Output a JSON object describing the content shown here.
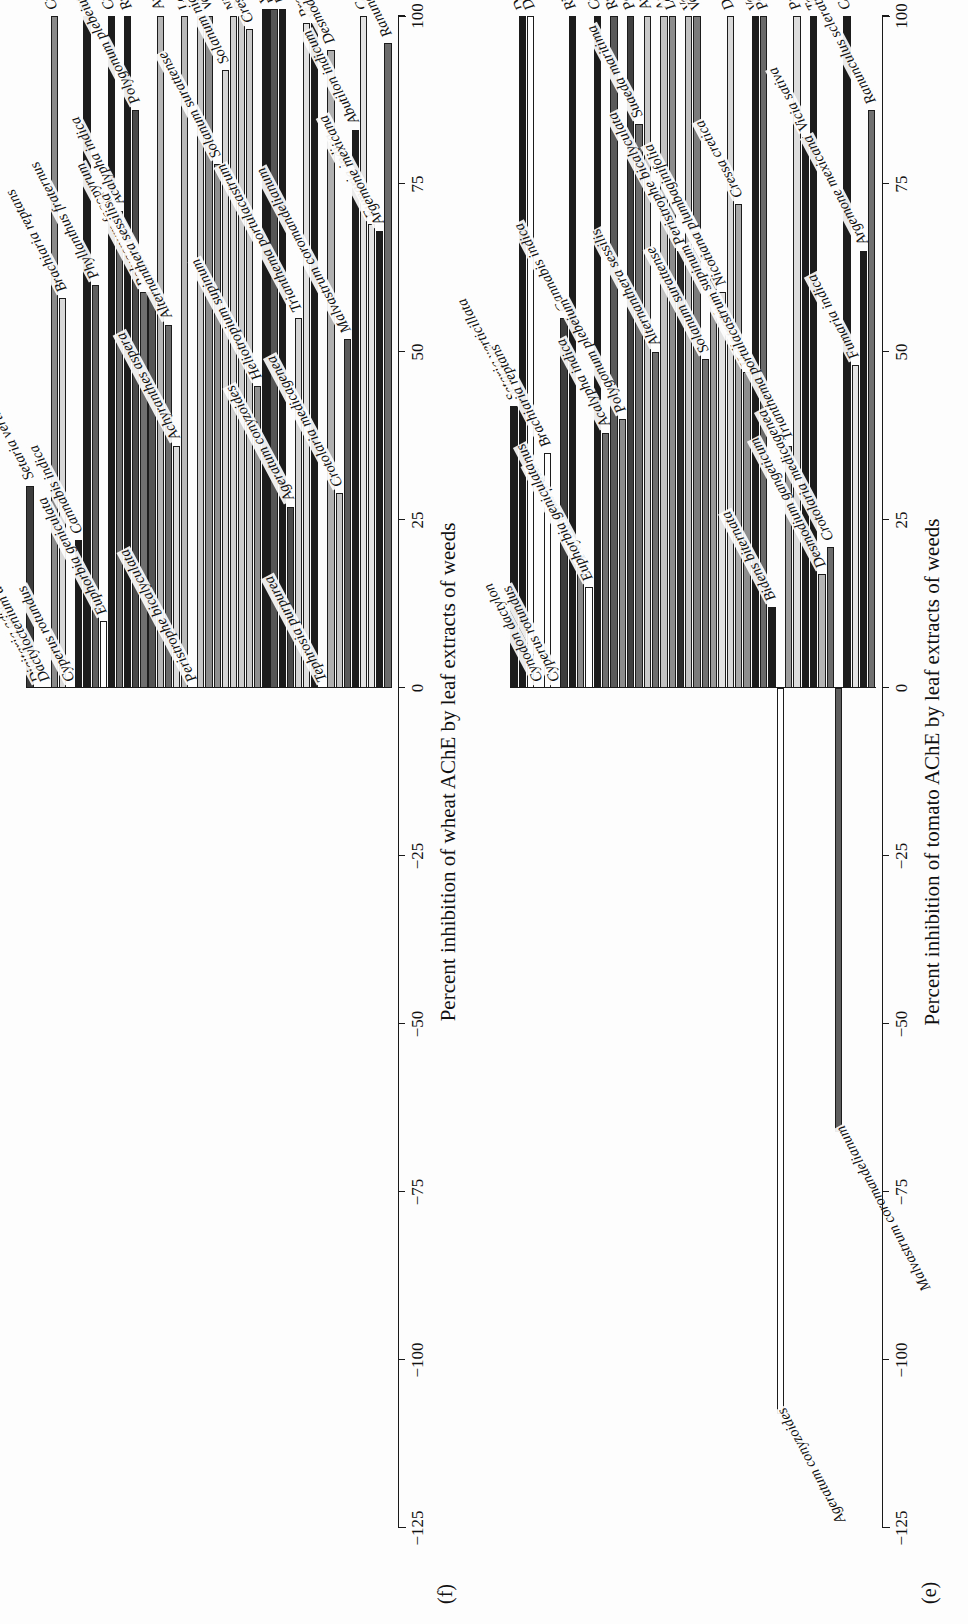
{
  "figure": {
    "background": "#fdfdfd",
    "orientation": "rotated-90-ccw"
  },
  "chart_data": [
    {
      "id": "e",
      "panel_letter": "(e)",
      "type": "bar",
      "orientation": "horizontal",
      "title": "",
      "xlabel": "Percent inhibition of tomato AChE by leaf extracts of weeds",
      "ylabel": "",
      "xlim": [
        -125,
        100
      ],
      "ticks": [
        -125,
        -100,
        -75,
        -50,
        -25,
        0,
        25,
        50,
        75,
        100
      ],
      "tick_labels": [
        "−125",
        "−100",
        "−75",
        "−50",
        "−25",
        "0",
        "25",
        "50",
        "75",
        "100"
      ],
      "grid": false,
      "legend": "none",
      "categories": [
        "Setaria verticillata",
        "Digitaria adscendens",
        "Dactyloctenium aegyptium",
        "Cynodon dactylon",
        "Brachiaria reptans",
        "Cyperus rotundus",
        "Cannabis indica",
        "Ricinus communis",
        "Phyllanthus fraternus",
        "Euphorbia geniculata",
        "Croton bonplandianum",
        "Acalypha indica",
        "Rumex dentatus",
        "Polygonum plebeium",
        "Polygonum fagopyrum",
        "Suaeda maritima",
        "Amaranthus gracilis",
        "Alternanthera sessilis",
        "Achyranthes aspera",
        "Lantana camara",
        "Peristrophe bicalyculata",
        "Veronica agrestis",
        "Verbascum chinense",
        "Solanum surattense",
        "Solanum nigrum",
        "Nicotiana plumbaginifolia",
        "Datura innoxia",
        "Cressa cretica",
        "Heliotropium supinum",
        "Vernonia cinerea",
        "Parthenium hysterophorus",
        "Bidens biternata",
        "Ageratum conyzoides",
        "Trianthema portulacastrum",
        "Prosopis juliflora",
        "Vicia sativa",
        "Tephrosia purpurea",
        "Desmodium gangeticum",
        "Crotolaria medicagenea",
        "Malvastrum coromandelianum",
        "Coronopus didymus",
        "Fumaria indica",
        "Argemone mexicana",
        "Ranunculus scleratus"
      ],
      "values": [
        42,
        100,
        100,
        0,
        35,
        0,
        55,
        100,
        18,
        15,
        100,
        38,
        100,
        40,
        100,
        84,
        100,
        50,
        100,
        100,
        65,
        100,
        100,
        49,
        61,
        59,
        100,
        72,
        47,
        100,
        100,
        12,
        -108,
        36,
        100,
        82,
        100,
        17,
        21,
        -66,
        100,
        48,
        65,
        86
      ],
      "bar_colors": [
        "#1c1c1c",
        "#1c1c1c",
        "#ffffff",
        "#ffffff",
        "#ffffff",
        "#1c1c1c",
        "#3d3d3d",
        "#1c1c1c",
        "#8a8a8a",
        "#ffffff",
        "#1c1c1c",
        "#6e6e6e",
        "#5a5a5a",
        "#8c8c8c",
        "#3f3f3f",
        "#6b6b6b",
        "#c9c9c9",
        "#6f6f6f",
        "#c2c2c2",
        "#8c8c8c",
        "#2a2a2a",
        "#c0c0c0",
        "#7b7b7b",
        "#707070",
        "#9a9a9a",
        "#e2e2e2",
        "#d8d8d8",
        "#a8a8a8",
        "#8e8e8e",
        "#1c1c1c",
        "#6a6a6a",
        "#1c1c1c",
        "#ffffff",
        "#9b9b9b",
        "#dcdcdc",
        "#1c1c1c",
        "#1c1c1c",
        "#b4b4b4",
        "#6b6b6b",
        "#5e5e5e",
        "#1c1c1c",
        "#e4e4e4",
        "#1c1c1c",
        "#707070"
      ]
    },
    {
      "id": "f",
      "panel_letter": "(f)",
      "type": "bar",
      "orientation": "horizontal",
      "title": "",
      "xlabel": "Percent inhibition of wheat AChE by leaf extracts of weeds",
      "ylabel": "",
      "xlim": [
        -125,
        100
      ],
      "ticks": [
        -125,
        -100,
        -75,
        -50,
        -25,
        0,
        25,
        50,
        75,
        100
      ],
      "tick_labels": [
        "−125",
        "−100",
        "−75",
        "−50",
        "−25",
        "0",
        "25",
        "50",
        "75",
        "100"
      ],
      "grid": false,
      "legend": "none",
      "categories": [
        "Setaria verticillata",
        "Digitaria adscendens",
        "Dactyloctenium aegyptium",
        "Cynodon dactylon",
        "Brachiaria reptans",
        "Cyperus rotundus",
        "Cannabis indica",
        "Ricinus communis",
        "Phyllanthus fraternus",
        "Euphorbia geniculata",
        "Croton bonplandianum",
        "Acalypha indica",
        "Rumex dentatus",
        "Polygonum plebeium",
        "Polygonum fagopyrum",
        "Suaeda maritima",
        "Amaranthus gracilis",
        "Alternanthera sessilis",
        "Achyranthes aspera",
        "Lantana camara",
        "Peristrophe bicalyculata",
        "Veronica agrestis",
        "Verbascum chinense",
        "Solanum surattense",
        "Solanum nigrum",
        "Nicotiana plumbaginifolia",
        "Datura innoxia",
        "Cressa cretica",
        "Heliotropium supinum",
        "Vernonia cinerea",
        "Parthenium hysterophorus",
        "Bidens biternata",
        "Ageratum conyzoides",
        "Trianthema portulacastrum",
        "Prosopis juliflora",
        "Vicia sativa",
        "Tephrosia purpurea",
        "Desmodium gangeticum",
        "Crotolaria medicagenea",
        "Malvastrum coromandelianum",
        "Abutilon indicum",
        "Coronopus didymus",
        "Fumaria indica",
        "Argemone mexicana",
        "Ranunculus scleratus"
      ],
      "values": [
        30,
        0,
        0,
        100,
        58,
        0,
        22,
        100,
        60,
        10,
        100,
        71,
        100,
        86,
        59,
        59,
        100,
        54,
        36,
        100,
        0,
        100,
        100,
        78,
        92,
        100,
        100,
        98,
        45,
        101,
        101,
        101,
        27,
        55,
        99,
        99,
        0,
        95,
        29,
        52,
        83,
        100,
        69,
        68,
        96
      ],
      "bar_colors": [
        "#3c3c3c",
        "#1c1c1c",
        "#1c1c1c",
        "#8a8a8a",
        "#d8d8d8",
        "#1c1c1c",
        "#1c1c1c",
        "#1c1c1c",
        "#5f5f5f",
        "#ffffff",
        "#1c1c1c",
        "#6a6a6a",
        "#1c1c1c",
        "#4a4a4a",
        "#6f6f6f",
        "#555555",
        "#b6b6b6",
        "#6a6a6a",
        "#dcdcdc",
        "#b9b9b9",
        "#1c1c1c",
        "#c6c6c6",
        "#8a8a8a",
        "#8f8f8f",
        "#d6d6d6",
        "#cfcfcf",
        "#cdcdcd",
        "#c8c8c8",
        "#8f8f8f",
        "#1c1c1c",
        "#555555",
        "#1c1c1c",
        "#4a4a4a",
        "#d4d4d4",
        "#e0e0e0",
        "#1c1c1c",
        "#1c1c1c",
        "#b0b0b0",
        "#c6c6c6",
        "#5a5a5a",
        "#1c1c1c",
        "#e2e2e2",
        "#e4e4e4",
        "#1c1c1c",
        "#6b6b6b"
      ]
    }
  ]
}
